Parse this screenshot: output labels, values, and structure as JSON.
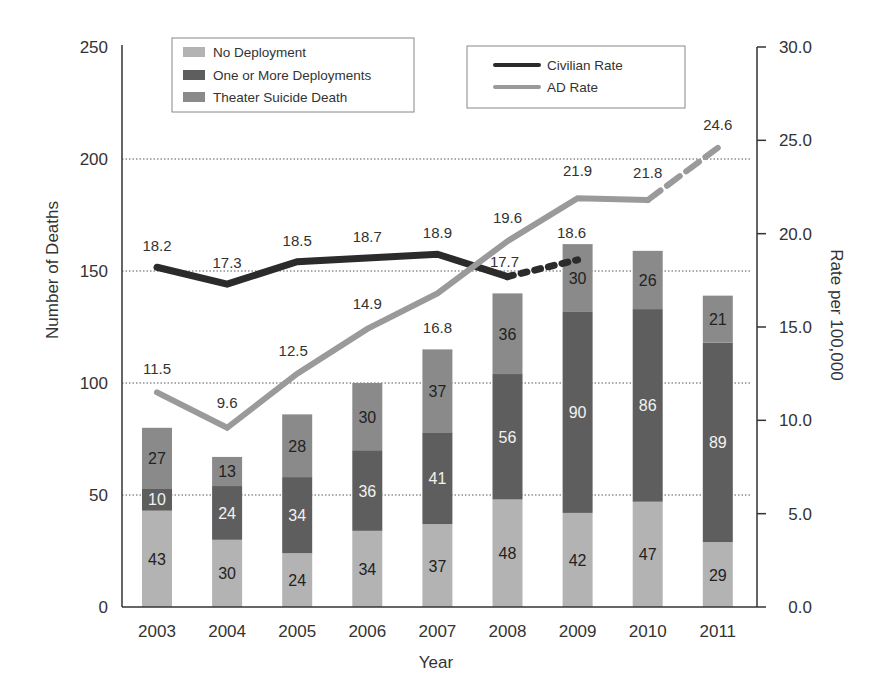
{
  "chart_data": {
    "type": "bar",
    "subtype": "stacked-bar-with-dual-axis-lines",
    "title": "",
    "xlabel": "Year",
    "ylabel": "Number of Deaths",
    "y2label": "Rate per 100,000",
    "categories": [
      "2003",
      "2004",
      "2005",
      "2006",
      "2007",
      "2008",
      "2009",
      "2010",
      "2011"
    ],
    "ylim": [
      0,
      250
    ],
    "yticks": [
      "0",
      "50",
      "100",
      "150",
      "200",
      "250"
    ],
    "y2lim": [
      0,
      30
    ],
    "y2ticks": [
      "0.0",
      "5.0",
      "10.0",
      "15.0",
      "20.0",
      "25.0",
      "30.0"
    ],
    "grid": "dotted horizontal at 50, 100, 150, 200",
    "series": [
      {
        "name": "No Deployment",
        "axis": "left",
        "kind": "bar",
        "color": "#b3b3b3",
        "values": [
          43,
          30,
          24,
          34,
          37,
          48,
          42,
          47,
          29
        ]
      },
      {
        "name": "One or More Deployments",
        "axis": "left",
        "kind": "bar",
        "color": "#5e5e5e",
        "values": [
          10,
          24,
          34,
          36,
          41,
          56,
          90,
          86,
          89
        ]
      },
      {
        "name": "Theater Suicide Death",
        "axis": "left",
        "kind": "bar",
        "color": "#8a8a8a",
        "values": [
          27,
          13,
          28,
          30,
          37,
          36,
          30,
          26,
          21
        ]
      },
      {
        "name": "Civilian Rate",
        "axis": "right",
        "kind": "line",
        "color": "#2b2b2b",
        "values": [
          18.2,
          17.3,
          18.5,
          18.7,
          18.9,
          17.7,
          18.6,
          null,
          null
        ],
        "labels": [
          "18.2",
          "17.3",
          "18.5",
          "18.7",
          "18.9",
          "17.7",
          "18.6",
          "",
          ""
        ],
        "dashed_from_index": 5
      },
      {
        "name": "AD Rate",
        "axis": "right",
        "kind": "line",
        "color": "#9a9a9a",
        "values": [
          11.5,
          9.6,
          12.5,
          14.9,
          16.8,
          19.6,
          21.9,
          21.8,
          24.6
        ],
        "labels": [
          "11.5",
          "9.6",
          "12.5",
          "14.9",
          "16.8",
          "19.6",
          "21.9",
          "21.8",
          "24.6"
        ],
        "dashed_from_index": 7
      }
    ],
    "legend": {
      "bars": [
        "No Deployment",
        "One or More Deployments",
        "Theater Suicide Death"
      ],
      "lines": [
        "Civilian Rate",
        "AD Rate"
      ],
      "position": "top-inside"
    }
  },
  "labels": {
    "xlabel": "Year",
    "ylabel": "Number of Deaths",
    "y2label": "Rate per 100,000",
    "legend_bar_0": "No Deployment",
    "legend_bar_1": "One or More Deployments",
    "legend_bar_2": "Theater Suicide Death",
    "legend_line_0": "Civilian Rate",
    "legend_line_1": "AD Rate"
  }
}
